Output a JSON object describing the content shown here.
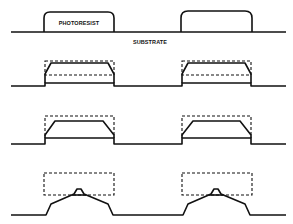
{
  "diagram": {
    "type": "process-cross-section",
    "labels": {
      "photoresist": "PHOTORESIST",
      "substrate": "SUBSTRATE"
    },
    "stages": [
      {
        "index": 1,
        "description": "Initial photoresist features on substrate"
      },
      {
        "index": 2,
        "description": "Slight sidewall slope; original profile dashed"
      },
      {
        "index": 3,
        "description": "Increased sidewall slope; original profile dashed"
      },
      {
        "index": 4,
        "description": "Resist reduced to peaked profile; original profile dashed"
      }
    ],
    "colors": {
      "line": "#111111",
      "background": "#ffffff"
    }
  }
}
